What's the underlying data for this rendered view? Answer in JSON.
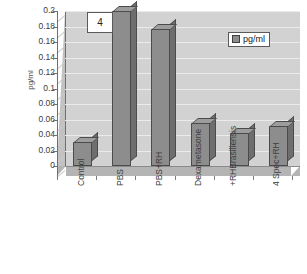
{
  "panel": {
    "number": "4"
  },
  "legend": {
    "label": "pg/ml",
    "swatch_color": "#8d8d8d",
    "position": "top-right"
  },
  "axis": {
    "y_title": "pg/ml",
    "y_ticks": [
      "0.2",
      "0.18",
      "0.16",
      "0.14",
      "0.12",
      "0.1",
      "0.08",
      "0.06",
      "0.04",
      "0.02",
      "0"
    ]
  },
  "chart_data": {
    "type": "bar",
    "title": "4",
    "xlabel": "",
    "ylabel": "pg/ml",
    "ylim": [
      0,
      0.2
    ],
    "ytick_step": 0.02,
    "grid": true,
    "legend": [
      "pg/ml"
    ],
    "categories": [
      "Control",
      "PBS",
      "PBS+RH",
      "Dexametasone",
      "Brasiliensis +RH",
      "4 Spec+RH"
    ],
    "category_lines": [
      [
        "Control"
      ],
      [
        "PBS"
      ],
      [
        "PBS+RH"
      ],
      [
        "Dexametasone"
      ],
      [
        "Brasiliensis",
        "+RH"
      ],
      [
        "4 Spec+RH"
      ]
    ],
    "series": [
      {
        "name": "pg/ml",
        "values": [
          0.031,
          0.2,
          0.177,
          0.055,
          0.043,
          0.052
        ]
      }
    ],
    "colors": {
      "bar_front": "#8d8d8d",
      "bar_side": "#6e6e6e",
      "bar_top": "#9d9d9d",
      "plot_background": "#d2d2d2",
      "floor": "#b4b4b4"
    }
  }
}
